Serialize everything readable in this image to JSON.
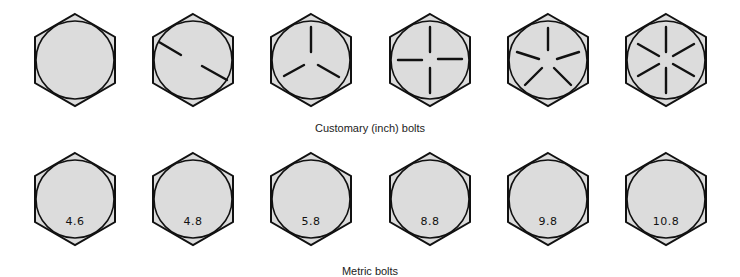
{
  "figure": {
    "customary": {
      "caption": "Customary (inch) bolts",
      "bolts": [
        {
          "marks": 0
        },
        {
          "marks": 2
        },
        {
          "marks": 3
        },
        {
          "marks": 4
        },
        {
          "marks": 5
        },
        {
          "marks": 6
        }
      ]
    },
    "metric": {
      "caption": "Metric bolts",
      "bolts": [
        {
          "grade": "4.6"
        },
        {
          "grade": "4.8"
        },
        {
          "grade": "5.8"
        },
        {
          "grade": "8.8"
        },
        {
          "grade": "9.8"
        },
        {
          "grade": "10.8"
        }
      ]
    },
    "colors": {
      "face": "#dcdcdc",
      "stroke": "#111111",
      "background": "#ffffff"
    }
  }
}
